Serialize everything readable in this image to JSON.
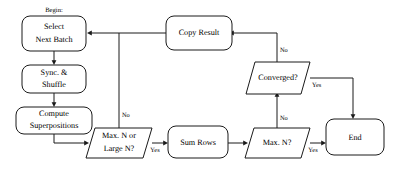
{
  "diagram": {
    "type": "flowchart",
    "title_caption": "Begin:",
    "background_color": "#ffffff",
    "line_color": "#1a1a1a",
    "text_color": "#000000",
    "nodes": [
      {
        "id": "select_next_batch",
        "label_line1": "Select",
        "label_line2": "Next Batch",
        "shape": "rounded-rect"
      },
      {
        "id": "sync_shuffle",
        "label_line1": "Sync. &",
        "label_line2": "Shuffle",
        "shape": "rounded-rect"
      },
      {
        "id": "compute_superpositions",
        "label_line1": "Compute",
        "label_line2": "Superpositions",
        "shape": "rounded-rect"
      },
      {
        "id": "max_n_or_large_n",
        "label_line1": "Max. N or",
        "label_line2": "Large N?",
        "shape": "parallelogram"
      },
      {
        "id": "sum_rows",
        "label_line1": "Sum Rows",
        "label_line2": "",
        "shape": "rounded-rect"
      },
      {
        "id": "max_n",
        "label_line1": "Max. N?",
        "label_line2": "",
        "shape": "parallelogram"
      },
      {
        "id": "end",
        "label_line1": "End",
        "label_line2": "",
        "shape": "rounded-rect"
      },
      {
        "id": "converged",
        "label_line1": "Converged?",
        "label_line2": "",
        "shape": "parallelogram"
      },
      {
        "id": "copy_result",
        "label_line1": "Copy Result",
        "label_line2": "",
        "shape": "rounded-rect"
      }
    ],
    "edge_labels": {
      "max_n_or_large_n_no": "No",
      "max_n_or_large_n_yes": "Yes",
      "max_n_no": "No",
      "max_n_yes": "Yes",
      "converged_no": "No",
      "converged_yes": "Yes"
    }
  }
}
